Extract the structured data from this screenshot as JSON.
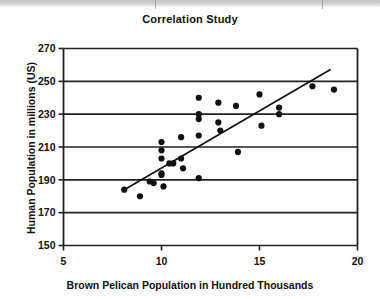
{
  "chart_data": {
    "type": "scatter",
    "title": "Correlation Study",
    "xlabel": "Brown Pelican Population in Hundred Thousands",
    "ylabel": "Human Population in millions (US)",
    "xlim": [
      5,
      20
    ],
    "ylim": [
      150,
      270
    ],
    "xticks": [
      5,
      10,
      15,
      20
    ],
    "xtick_labels": [
      "5",
      "10",
      "15",
      "20"
    ],
    "yticks": [
      150,
      170,
      190,
      210,
      230,
      250,
      270
    ],
    "ytick_labels": [
      "150",
      "170",
      "190",
      "210",
      "230",
      "250",
      "270"
    ],
    "grid": "horizontal",
    "legend": "none",
    "marker": "filled-circle",
    "marker_color": "#111111",
    "points": [
      {
        "x": 8.1,
        "y": 184
      },
      {
        "x": 8.9,
        "y": 180
      },
      {
        "x": 9.4,
        "y": 189
      },
      {
        "x": 9.6,
        "y": 188
      },
      {
        "x": 10.0,
        "y": 213
      },
      {
        "x": 10.0,
        "y": 208
      },
      {
        "x": 10.0,
        "y": 203
      },
      {
        "x": 10.0,
        "y": 194
      },
      {
        "x": 10.0,
        "y": 193
      },
      {
        "x": 10.1,
        "y": 186
      },
      {
        "x": 10.4,
        "y": 200
      },
      {
        "x": 10.6,
        "y": 200
      },
      {
        "x": 11.0,
        "y": 216
      },
      {
        "x": 11.0,
        "y": 203
      },
      {
        "x": 11.1,
        "y": 197
      },
      {
        "x": 11.9,
        "y": 240
      },
      {
        "x": 11.9,
        "y": 230
      },
      {
        "x": 11.9,
        "y": 227
      },
      {
        "x": 11.9,
        "y": 217
      },
      {
        "x": 11.9,
        "y": 191
      },
      {
        "x": 12.9,
        "y": 237
      },
      {
        "x": 12.9,
        "y": 225
      },
      {
        "x": 13.0,
        "y": 220
      },
      {
        "x": 13.8,
        "y": 235
      },
      {
        "x": 13.9,
        "y": 207
      },
      {
        "x": 15.0,
        "y": 242
      },
      {
        "x": 15.1,
        "y": 223
      },
      {
        "x": 16.0,
        "y": 234
      },
      {
        "x": 16.0,
        "y": 230
      },
      {
        "x": 17.7,
        "y": 247
      },
      {
        "x": 18.8,
        "y": 245
      }
    ],
    "trendline": {
      "type": "linear",
      "x_start": 8.1,
      "y_start": 184,
      "x_end": 18.6,
      "y_end": 257
    }
  }
}
